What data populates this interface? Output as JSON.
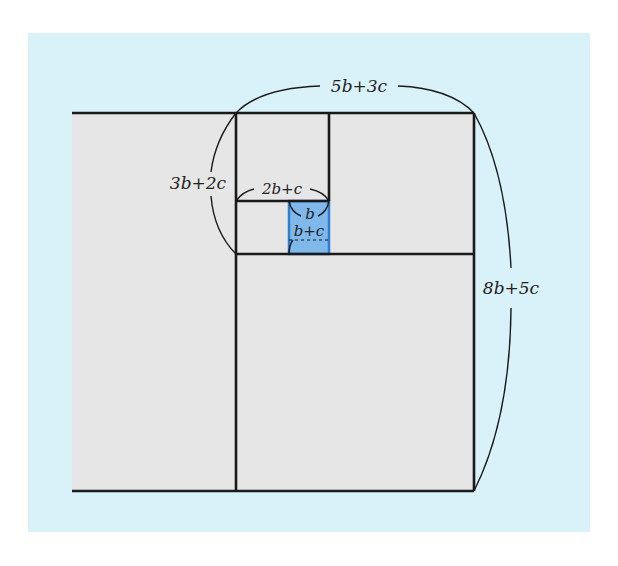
{
  "diagram": {
    "title": "",
    "colors": {
      "page_background": "#ffffff",
      "panel_background": "#d9f1f8",
      "region_fill": "#e6e6e6",
      "highlight_fill": "#7fb8ea",
      "highlight_stroke": "#2f7fd0",
      "line": "#1a1a1a"
    },
    "labels": {
      "top_width": "5b+3c",
      "right_height": "8b+5c",
      "left_height": "3b+2c",
      "inner_width": "2b+c",
      "blue_top": "b",
      "blue_side": "b+c"
    }
  }
}
